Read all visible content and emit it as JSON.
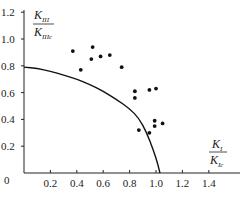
{
  "chart_data": {
    "type": "scatter",
    "title": "",
    "xlabel": "K_I / K_Ic",
    "ylabel": "K_III / K_IIIc",
    "xlabel_parts": {
      "num_main": "K",
      "num_sub": "I",
      "den_main": "K",
      "den_sub": "Ic"
    },
    "ylabel_parts": {
      "num_main": "K",
      "num_sub": "III",
      "den_main": "K",
      "den_sub": "IIIc"
    },
    "xlim": [
      0,
      1.6
    ],
    "ylim": [
      0,
      1.2
    ],
    "xticks": [
      0.2,
      0.4,
      0.6,
      0.8,
      1.0,
      1.2,
      1.4
    ],
    "xtick_labels": [
      "0.2",
      "0.4",
      "0.6",
      "0.8",
      "1.0",
      "1.2",
      "1.4"
    ],
    "yticks": [
      0.2,
      0.4,
      0.6,
      0.8,
      1.0,
      1.2
    ],
    "ytick_labels": [
      "0.2",
      "0.4",
      "0.6",
      "0.8",
      "1.0",
      "1.2"
    ],
    "origin_label": "0",
    "grid": false,
    "legend": null,
    "series": [
      {
        "name": "experimental data",
        "kind": "scatter",
        "points": [
          [
            0.37,
            0.91
          ],
          [
            0.43,
            0.77
          ],
          [
            0.52,
            0.94
          ],
          [
            0.51,
            0.85
          ],
          [
            0.58,
            0.87
          ],
          [
            0.65,
            0.88
          ],
          [
            0.74,
            0.79
          ],
          [
            0.84,
            0.61
          ],
          [
            0.84,
            0.56
          ],
          [
            0.95,
            0.62
          ],
          [
            1.0,
            0.63
          ],
          [
            0.99,
            0.39
          ],
          [
            0.99,
            0.35
          ],
          [
            1.05,
            0.37
          ],
          [
            0.87,
            0.32
          ],
          [
            0.95,
            0.3
          ]
        ]
      },
      {
        "name": "fracture criterion curve",
        "kind": "line",
        "points": [
          [
            0.0,
            0.79
          ],
          [
            0.1,
            0.78
          ],
          [
            0.2,
            0.76
          ],
          [
            0.3,
            0.73
          ],
          [
            0.4,
            0.7
          ],
          [
            0.5,
            0.66
          ],
          [
            0.6,
            0.61
          ],
          [
            0.7,
            0.55
          ],
          [
            0.8,
            0.48
          ],
          [
            0.87,
            0.41
          ],
          [
            0.93,
            0.3
          ],
          [
            0.98,
            0.17
          ],
          [
            1.01,
            0.08
          ],
          [
            1.03,
            0.0
          ]
        ]
      }
    ]
  }
}
